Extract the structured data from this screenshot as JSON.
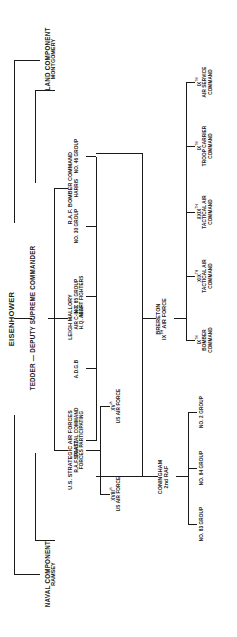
{
  "chart_title": "Allied Expeditionary Force command structure",
  "supreme": {
    "commander": "EISENHOWER",
    "deputy": "TEDDER — DEPUTY SUPREME COMMANDER"
  },
  "components": {
    "naval": {
      "title": "NAVAL COMPONENT",
      "commander": "RAMSEY"
    },
    "land": {
      "title": "LAND COMPONENT",
      "commander": "MONTGOMERY"
    }
  },
  "air": {
    "aeaf": {
      "commander": "LEIGH MALLORY",
      "role": "AIR C-IN-C",
      "hq": "H.Q. AEAF"
    },
    "strategic": {
      "title": "U.S. STRATEGIC AIR FORCES",
      "commander": "SPAATZ"
    },
    "strategic_children": [
      {
        "numeral": "XVIII",
        "suffix": "th",
        "label": "US AIR FORCE"
      },
      {
        "numeral": "XV",
        "suffix": "th",
        "label": "US AIR FORCE"
      }
    ],
    "bomber_command": {
      "title": "R.A.F. BOMBER COMMAND",
      "commander": "HARRIS"
    },
    "aeaf_children": [
      {
        "line1": "R.A.F. COASTAL COMMAND",
        "line2": "FORCES PARTICIPATING"
      },
      {
        "line1": "A.D.G.B",
        "line2": ""
      },
      {
        "line1": "NO. 85 GROUP",
        "line2": "NIGHT FIGHTERS"
      },
      {
        "line1": "NO. 30 GROUP",
        "line2": ""
      },
      {
        "line1": "NO. 46 GROUP",
        "line2": ""
      }
    ],
    "second_taf": {
      "commander": "CONINGHAM",
      "title": "2nd RAF"
    },
    "second_taf_children": [
      {
        "label": "NO. 83 GROUP"
      },
      {
        "label": "NO. 84 GROUP"
      },
      {
        "label": "NO. 2 GROUP"
      }
    ],
    "ninth_af": {
      "commander": "BRERETON",
      "title": "IX",
      "suffix": "TH",
      "title_tail": " AIR FORCE"
    },
    "ninth_af_children": [
      {
        "numeral": "IX",
        "suffix": "TH",
        "line1": "BOMBER",
        "line2": "COMMAND"
      },
      {
        "numeral": "XIX",
        "suffix": "TH",
        "line1": "TACTICAL AIR",
        "line2": "COMMAND"
      },
      {
        "numeral": "XXIX",
        "suffix": "TH",
        "line1": "TACTICAL AIR",
        "line2": "COMMAND"
      },
      {
        "numeral": "IX",
        "suffix": "TH",
        "line1": "TROOP CARRIER",
        "line2": "COMMAND"
      },
      {
        "numeral": "IX",
        "suffix": "TH",
        "line1": "AIR SERVICE",
        "line2": "COMMAND"
      }
    ]
  },
  "colors": {
    "ink": "#1a1a1a",
    "paper": "#ffffff"
  }
}
